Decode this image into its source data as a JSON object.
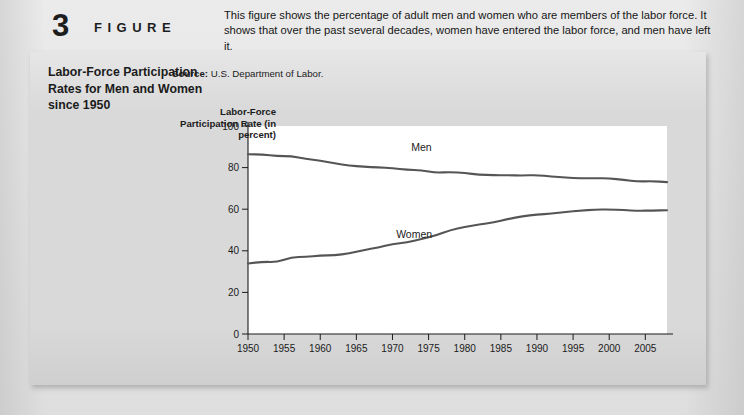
{
  "figure": {
    "number": "3",
    "word": "FIGURE",
    "title": "Labor-Force Participation Rates for Men and Women since 1950",
    "description": "This figure shows the percentage of adult men and women who are members of the labor force. It shows that over the past several decades, women have entered the labor force, and men have left it.",
    "source_label": "Source:",
    "source_text": "U.S. Department of Labor."
  },
  "colors": {
    "panel_background": "#d9d9d9",
    "page_background": "#e8e8e8",
    "plot_background": "#ffffff",
    "axis": "#1b1b1b",
    "men_line": "#555555",
    "women_line": "#555555"
  },
  "chart_data": {
    "type": "line",
    "title": "Labor-Force Participation Rates for Men and Women since 1950",
    "xlabel": "",
    "ylabel": "Labor-Force Participation Rate (in percent)",
    "xlim": [
      1950,
      2008
    ],
    "ylim": [
      0,
      100
    ],
    "yticks": [
      0,
      20,
      40,
      60,
      80,
      100
    ],
    "ytick_labels": [
      "0",
      "20",
      "40",
      "60",
      "80",
      "100"
    ],
    "xticks": [
      1950,
      1955,
      1960,
      1965,
      1970,
      1975,
      1980,
      1985,
      1990,
      1995,
      2000,
      2005
    ],
    "xtick_labels": [
      "1950",
      "1955",
      "1960",
      "1965",
      "1970",
      "1975",
      "1980",
      "1985",
      "1990",
      "1995",
      "2000",
      "2005"
    ],
    "grid": false,
    "legend_position": "inline-labels",
    "x": [
      1950,
      1952,
      1954,
      1956,
      1958,
      1960,
      1962,
      1964,
      1966,
      1968,
      1970,
      1972,
      1974,
      1976,
      1978,
      1980,
      1982,
      1984,
      1986,
      1988,
      1990,
      1992,
      1994,
      1996,
      1998,
      2000,
      2002,
      2004,
      2006,
      2008
    ],
    "series": [
      {
        "name": "Men",
        "label": "Men",
        "color": "#555555",
        "values": [
          86.4,
          86.3,
          85.5,
          85.5,
          84.2,
          83.3,
          82.0,
          81.0,
          80.4,
          80.1,
          79.7,
          79.0,
          78.7,
          77.5,
          77.9,
          77.4,
          76.6,
          76.4,
          76.3,
          76.2,
          76.4,
          75.8,
          75.1,
          74.9,
          74.9,
          74.8,
          74.1,
          73.3,
          73.5,
          73.0
        ],
        "start_value": 86.4,
        "end_value": 75.0,
        "trend": "declining"
      },
      {
        "name": "Women",
        "label": "Women",
        "color": "#555555",
        "values": [
          33.9,
          34.7,
          34.6,
          36.9,
          37.1,
          37.7,
          37.9,
          38.7,
          40.3,
          41.6,
          43.3,
          43.9,
          45.7,
          47.3,
          50.0,
          51.5,
          52.6,
          53.6,
          55.3,
          56.6,
          57.5,
          57.8,
          58.8,
          59.3,
          59.8,
          59.9,
          59.6,
          59.2,
          59.4,
          59.5
        ],
        "start_value": 33.9,
        "end_value": 61.0,
        "trend": "rising"
      }
    ],
    "annotations": [
      {
        "text": "Men",
        "x": 1974,
        "y": 88
      },
      {
        "text": "Women",
        "x": 1973,
        "y": 46
      }
    ]
  }
}
